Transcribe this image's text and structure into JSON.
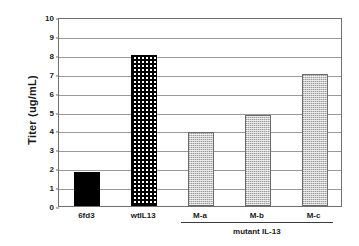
{
  "chart_data": {
    "type": "bar",
    "title": "",
    "xlabel": "",
    "ylabel": "Titer (ug/mL)",
    "categories": [
      "6fd3",
      "wtIL13",
      "M-a",
      "M-b",
      "M-c"
    ],
    "values": [
      1.8,
      8.0,
      3.9,
      4.8,
      7.0
    ],
    "ylim": [
      0,
      10
    ],
    "yticks": [
      0,
      1,
      2,
      3,
      4,
      5,
      6,
      7,
      8,
      9,
      10
    ],
    "ytick_labels": [
      "0",
      "1",
      "2",
      "3",
      "4",
      "5",
      "6",
      "7",
      "8",
      "9",
      "10"
    ],
    "grid": true,
    "legend": "none",
    "bar_styles": [
      "solid-black",
      "checker",
      "stipple",
      "stipple",
      "stipple"
    ],
    "annotations": [
      {
        "text": "mutant IL-13",
        "covers": [
          "M-a",
          "M-b",
          "M-c"
        ],
        "position": "below-axis-bracket"
      }
    ]
  },
  "axis": {
    "y_title": "Titer (ug/mL)",
    "ticks": [
      {
        "value": 10,
        "label": "10"
      },
      {
        "value": 9,
        "label": "9"
      },
      {
        "value": 8,
        "label": "8"
      },
      {
        "value": 7,
        "label": "7"
      },
      {
        "value": 6,
        "label": "6"
      },
      {
        "value": 5,
        "label": "5"
      },
      {
        "value": 4,
        "label": "4"
      },
      {
        "value": 3,
        "label": "3"
      },
      {
        "value": 2,
        "label": "2"
      },
      {
        "value": 1,
        "label": "1"
      },
      {
        "value": 0,
        "label": "0"
      }
    ]
  },
  "bars": [
    {
      "label": "6fd3",
      "value": 1.8,
      "style": "solid-black"
    },
    {
      "label": "wtIL13",
      "value": 8.0,
      "style": "checker"
    },
    {
      "label": "M-a",
      "value": 3.9,
      "style": "stipple"
    },
    {
      "label": "M-b",
      "value": 4.8,
      "style": "stipple"
    },
    {
      "label": "M-c",
      "value": 7.0,
      "style": "stipple"
    }
  ],
  "group": {
    "label": "mutant IL-13"
  },
  "colors": {
    "bar_black": "#000000",
    "bar_gray": "#c9c9c9",
    "gridline": "#9a9a9a",
    "frame": "#6f6f6f",
    "background": "#ffffff"
  }
}
